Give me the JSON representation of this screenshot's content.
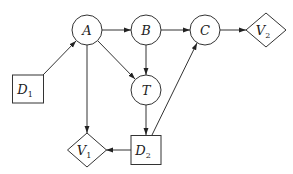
{
  "diagram": {
    "type": "influence-diagram",
    "nodes": [
      {
        "id": "A",
        "label": "A",
        "sub": "",
        "shape": "circle"
      },
      {
        "id": "B",
        "label": "B",
        "sub": "",
        "shape": "circle"
      },
      {
        "id": "C",
        "label": "C",
        "sub": "",
        "shape": "circle"
      },
      {
        "id": "T",
        "label": "T",
        "sub": "",
        "shape": "circle"
      },
      {
        "id": "D1",
        "label": "D",
        "sub": "1",
        "shape": "square"
      },
      {
        "id": "D2",
        "label": "D",
        "sub": "2",
        "shape": "square"
      },
      {
        "id": "V1",
        "label": "V",
        "sub": "1",
        "shape": "diamond"
      },
      {
        "id": "V2",
        "label": "V",
        "sub": "2",
        "shape": "diamond"
      }
    ],
    "edges": [
      {
        "from": "D1",
        "to": "A"
      },
      {
        "from": "A",
        "to": "B"
      },
      {
        "from": "B",
        "to": "C"
      },
      {
        "from": "C",
        "to": "V2"
      },
      {
        "from": "A",
        "to": "T"
      },
      {
        "from": "B",
        "to": "T"
      },
      {
        "from": "A",
        "to": "V1"
      },
      {
        "from": "T",
        "to": "D2"
      },
      {
        "from": "D2",
        "to": "V1"
      },
      {
        "from": "D2",
        "to": "C"
      }
    ],
    "colors": {
      "stroke": "#333333",
      "fill": "#ffffff",
      "text": "#222222"
    }
  }
}
